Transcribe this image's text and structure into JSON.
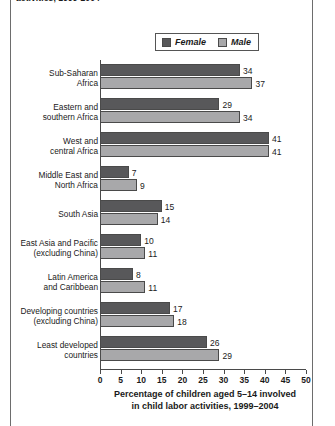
{
  "caption_clipped": "activities, 1999-2004",
  "legend": {
    "position": "top-center",
    "entries": [
      {
        "label": "Female",
        "color": "#58585a",
        "name": "legend-female"
      },
      {
        "label": "Male",
        "color": "#a8a8aa",
        "name": "legend-male"
      }
    ]
  },
  "axis_title_line1": "Percentage of children aged 5–14 involved",
  "axis_title_line2": "in child labor activities, 1999–2004",
  "chart_data": {
    "type": "bar",
    "orientation": "horizontal",
    "title": "",
    "xlabel": "Percentage of children aged 5–14 involved in child labor activities, 1999–2004",
    "ylabel": "",
    "xlim": [
      0,
      50
    ],
    "xticks": [
      0,
      5,
      10,
      15,
      20,
      25,
      30,
      35,
      40,
      45,
      50
    ],
    "grid": false,
    "legend_position": "top-center",
    "categories": [
      "Sub-Saharan\nAfrica",
      "Eastern and\nsouthern Africa",
      "West and\ncentral Africa",
      "Middle East and\nNorth Africa",
      "South Asia",
      "East Asia and Pacific\n(excluding China)",
      "Latin America\nand Caribbean",
      "Developing countries\n(excluding China)",
      "Least developed\ncountries"
    ],
    "series": [
      {
        "name": "Female",
        "color": "#58585a",
        "values": [
          34,
          29,
          41,
          7,
          15,
          10,
          8,
          17,
          26
        ]
      },
      {
        "name": "Male",
        "color": "#a8a8aa",
        "values": [
          37,
          34,
          41,
          9,
          14,
          11,
          11,
          18,
          29
        ]
      }
    ]
  }
}
